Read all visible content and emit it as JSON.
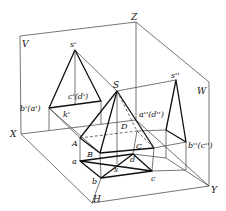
{
  "diagram": {
    "planes": {
      "V": "V",
      "H": "H",
      "W": "W"
    },
    "axes": {
      "X": "X",
      "Y": "Y",
      "Z": "Z"
    },
    "space_points": {
      "S": "S",
      "A": "A",
      "B": "B",
      "C": "C",
      "D": "D"
    },
    "v_projection": {
      "apex": "s'",
      "base_left": "b'(a')",
      "base_right": "c'(d')",
      "k": "k'"
    },
    "w_projection": {
      "apex": "s''",
      "base_left": "a''(d'')",
      "base_right": "b''(c'')"
    },
    "h_projection": {
      "a": "a",
      "b": "b",
      "c": "c",
      "d": "d",
      "s": "s"
    },
    "colors": {
      "line": "#111111",
      "thin_line": "#3a3a3a",
      "background": "#ffffff"
    }
  }
}
